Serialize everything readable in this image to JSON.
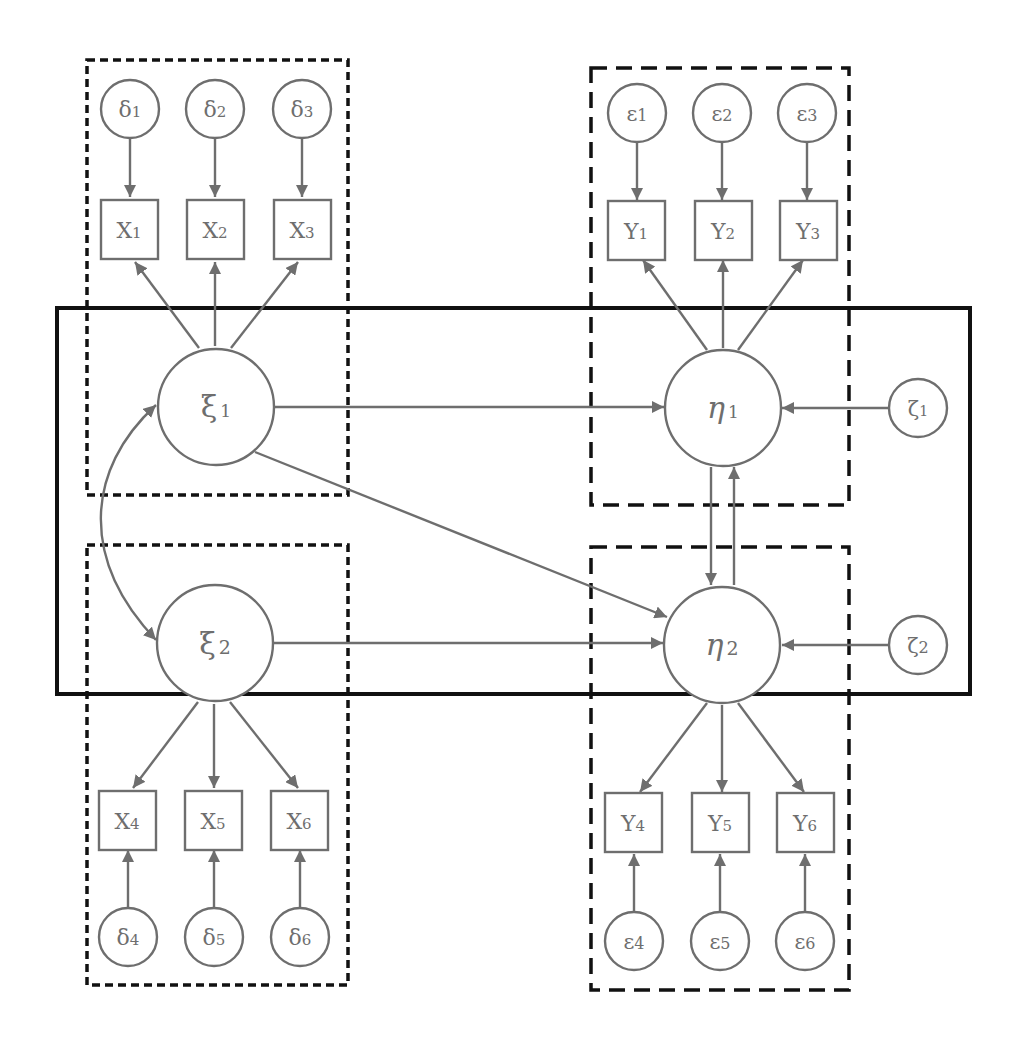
{
  "diagram": {
    "type": "structural-equation-model",
    "colors": {
      "node_stroke": "#6e6e6e",
      "group_stroke": "#111111",
      "background": "#ffffff"
    },
    "exogenous_latent": [
      {
        "id": "xi1",
        "symbol": "ξ",
        "sub": "1"
      },
      {
        "id": "xi2",
        "symbol": "ξ",
        "sub": "2"
      }
    ],
    "endogenous_latent": [
      {
        "id": "eta1",
        "symbol": "η",
        "sub": "1"
      },
      {
        "id": "eta2",
        "symbol": "η",
        "sub": "2"
      }
    ],
    "disturbances": [
      {
        "id": "zeta1",
        "symbol": "ζ",
        "sub": "1"
      },
      {
        "id": "zeta2",
        "symbol": "ζ",
        "sub": "2"
      }
    ],
    "x_indicators": [
      {
        "id": "X1",
        "symbol": "X",
        "sub": "1"
      },
      {
        "id": "X2",
        "symbol": "X",
        "sub": "2"
      },
      {
        "id": "X3",
        "symbol": "X",
        "sub": "3"
      },
      {
        "id": "X4",
        "symbol": "X",
        "sub": "4"
      },
      {
        "id": "X5",
        "symbol": "X",
        "sub": "5"
      },
      {
        "id": "X6",
        "symbol": "X",
        "sub": "6"
      }
    ],
    "y_indicators": [
      {
        "id": "Y1",
        "symbol": "Y",
        "sub": "1"
      },
      {
        "id": "Y2",
        "symbol": "Y",
        "sub": "2"
      },
      {
        "id": "Y3",
        "symbol": "Y",
        "sub": "3"
      },
      {
        "id": "Y4",
        "symbol": "Y",
        "sub": "4"
      },
      {
        "id": "Y5",
        "symbol": "Y",
        "sub": "5"
      },
      {
        "id": "Y6",
        "symbol": "Y",
        "sub": "6"
      }
    ],
    "x_errors": [
      {
        "id": "delta1",
        "symbol": "δ",
        "sub": "1"
      },
      {
        "id": "delta2",
        "symbol": "δ",
        "sub": "2"
      },
      {
        "id": "delta3",
        "symbol": "δ",
        "sub": "3"
      },
      {
        "id": "delta4",
        "symbol": "δ",
        "sub": "4"
      },
      {
        "id": "delta5",
        "symbol": "δ",
        "sub": "5"
      },
      {
        "id": "delta6",
        "symbol": "δ",
        "sub": "6"
      }
    ],
    "y_errors": [
      {
        "id": "eps1",
        "symbol": "ε",
        "sub": "1"
      },
      {
        "id": "eps2",
        "symbol": "ε",
        "sub": "2"
      },
      {
        "id": "eps3",
        "symbol": "ε",
        "sub": "3"
      },
      {
        "id": "eps4",
        "symbol": "ε",
        "sub": "4"
      },
      {
        "id": "eps5",
        "symbol": "ε",
        "sub": "5"
      },
      {
        "id": "eps6",
        "symbol": "ε",
        "sub": "6"
      }
    ],
    "edges": [
      {
        "from": "delta1",
        "to": "X1"
      },
      {
        "from": "delta2",
        "to": "X2"
      },
      {
        "from": "delta3",
        "to": "X3"
      },
      {
        "from": "xi1",
        "to": "X1"
      },
      {
        "from": "xi1",
        "to": "X2"
      },
      {
        "from": "xi1",
        "to": "X3"
      },
      {
        "from": "delta4",
        "to": "X4"
      },
      {
        "from": "delta5",
        "to": "X5"
      },
      {
        "from": "delta6",
        "to": "X6"
      },
      {
        "from": "xi2",
        "to": "X4"
      },
      {
        "from": "xi2",
        "to": "X5"
      },
      {
        "from": "xi2",
        "to": "X6"
      },
      {
        "from": "eps1",
        "to": "Y1"
      },
      {
        "from": "eps2",
        "to": "Y2"
      },
      {
        "from": "eps3",
        "to": "Y3"
      },
      {
        "from": "eta1",
        "to": "Y1"
      },
      {
        "from": "eta1",
        "to": "Y2"
      },
      {
        "from": "eta1",
        "to": "Y3"
      },
      {
        "from": "eps4",
        "to": "Y4"
      },
      {
        "from": "eps5",
        "to": "Y5"
      },
      {
        "from": "eps6",
        "to": "Y6"
      },
      {
        "from": "eta2",
        "to": "Y4"
      },
      {
        "from": "eta2",
        "to": "Y5"
      },
      {
        "from": "eta2",
        "to": "Y6"
      },
      {
        "from": "xi1",
        "to": "eta1"
      },
      {
        "from": "xi1",
        "to": "eta2"
      },
      {
        "from": "xi2",
        "to": "eta2"
      },
      {
        "from": "zeta1",
        "to": "eta1"
      },
      {
        "from": "zeta2",
        "to": "eta2"
      },
      {
        "from": "eta1",
        "to": "eta2"
      },
      {
        "from": "eta2",
        "to": "eta1"
      },
      {
        "from": "xi1",
        "to": "xi2",
        "bidirectional": true
      }
    ],
    "groups": [
      {
        "id": "x-measurement-top",
        "style": "dotted",
        "contains": [
          "delta1",
          "delta2",
          "delta3",
          "X1",
          "X2",
          "X3",
          "xi1"
        ]
      },
      {
        "id": "x-measurement-bottom",
        "style": "dotted",
        "contains": [
          "xi2",
          "X4",
          "X5",
          "X6",
          "delta4",
          "delta5",
          "delta6"
        ]
      },
      {
        "id": "y-measurement-top",
        "style": "dashed",
        "contains": [
          "eps1",
          "eps2",
          "eps3",
          "Y1",
          "Y2",
          "Y3",
          "eta1"
        ]
      },
      {
        "id": "y-measurement-bottom",
        "style": "dashed",
        "contains": [
          "eta2",
          "Y4",
          "Y5",
          "Y6",
          "eps4",
          "eps5",
          "eps6"
        ]
      },
      {
        "id": "structural-model",
        "style": "solid",
        "contains": [
          "xi1",
          "xi2",
          "eta1",
          "eta2",
          "zeta1",
          "zeta2"
        ]
      }
    ]
  }
}
